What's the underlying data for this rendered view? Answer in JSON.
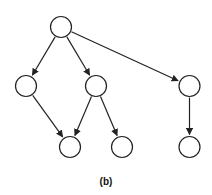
{
  "figure": {
    "caption": "(b)",
    "stroke_color": "#222222",
    "fill_color": "#ffffff",
    "node_radius": 10.5,
    "nodes": [
      {
        "id": "root",
        "x": 61,
        "y": 27
      },
      {
        "id": "a",
        "x": 26,
        "y": 86
      },
      {
        "id": "b",
        "x": 96,
        "y": 86
      },
      {
        "id": "c",
        "x": 189.5,
        "y": 86
      },
      {
        "id": "d",
        "x": 70,
        "y": 147
      },
      {
        "id": "e",
        "x": 122,
        "y": 147
      },
      {
        "id": "f",
        "x": 189.5,
        "y": 147
      }
    ],
    "edges": [
      {
        "from": "root",
        "to": "a"
      },
      {
        "from": "root",
        "to": "b"
      },
      {
        "from": "root",
        "to": "c"
      },
      {
        "from": "a",
        "to": "d"
      },
      {
        "from": "b",
        "to": "d"
      },
      {
        "from": "b",
        "to": "e"
      },
      {
        "from": "c",
        "to": "f"
      }
    ]
  }
}
